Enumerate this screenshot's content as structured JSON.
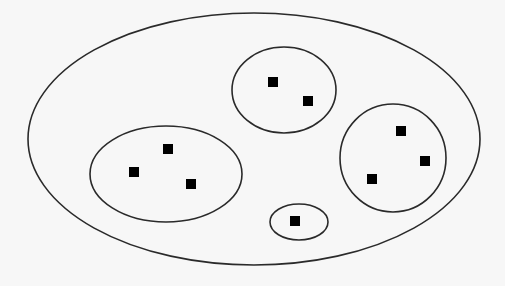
{
  "diagram": {
    "background": "#f7f7f7",
    "stroke_color": "#2a2a2a",
    "point_color": "#000000",
    "outer_set": {
      "cx": 254,
      "cy": 139,
      "rx": 226,
      "ry": 126
    },
    "clusters": [
      {
        "name": "cluster-top",
        "cx": 284,
        "cy": 90,
        "rx": 52,
        "ry": 43,
        "points": [
          [
            273,
            82
          ],
          [
            308,
            101
          ]
        ]
      },
      {
        "name": "cluster-left",
        "cx": 166,
        "cy": 174,
        "rx": 76,
        "ry": 48,
        "points": [
          [
            168,
            149
          ],
          [
            134,
            172
          ],
          [
            191,
            184
          ]
        ]
      },
      {
        "name": "cluster-right",
        "cx": 393,
        "cy": 158,
        "rx": 53,
        "ry": 54,
        "points": [
          [
            401,
            131
          ],
          [
            425,
            161
          ],
          [
            372,
            179
          ]
        ]
      },
      {
        "name": "cluster-small",
        "cx": 299,
        "cy": 222,
        "rx": 29,
        "ry": 18,
        "points": [
          [
            295,
            221
          ]
        ]
      }
    ],
    "point_size": 10
  }
}
